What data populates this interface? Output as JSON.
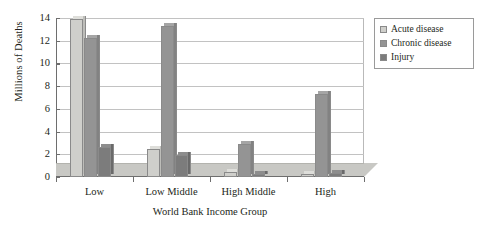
{
  "chart_data": {
    "type": "bar",
    "title": "",
    "xlabel": "World Bank Income Group",
    "ylabel": "Millions of Deaths",
    "ylim": [
      0,
      14
    ],
    "yticks": [
      0,
      2,
      4,
      6,
      8,
      10,
      12,
      14
    ],
    "grid": true,
    "legend_position": "right",
    "categories": [
      "Low",
      "Low Middle",
      "High Middle",
      "High"
    ],
    "series": [
      {
        "name": "Acute disease",
        "color": "#cfcfcb",
        "values": [
          13.9,
          2.5,
          0.4,
          0.3
        ]
      },
      {
        "name": "Chronic disease",
        "color": "#949494",
        "values": [
          12.2,
          13.3,
          2.9,
          7.3
        ]
      },
      {
        "name": "Injury",
        "color": "#7c7c7c",
        "values": [
          2.6,
          1.9,
          0.3,
          0.35
        ]
      }
    ]
  },
  "legend": {
    "items": [
      {
        "label": "Acute disease"
      },
      {
        "label": "Chronic disease"
      },
      {
        "label": "Injury"
      }
    ]
  }
}
